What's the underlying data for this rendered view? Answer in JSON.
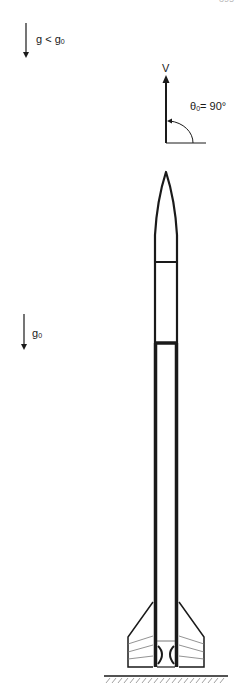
{
  "page_number": "395",
  "labels": {
    "gravity_upper": {
      "main": "g < g",
      "sub": "0"
    },
    "gravity_lower": {
      "main": "g",
      "sub": "0"
    },
    "velocity": "V",
    "angle": {
      "symbol": "θ",
      "sub": "0",
      "value": "= 90°"
    }
  },
  "diagram": {
    "parts": [
      "nose cone",
      "payload section",
      "motor tube",
      "fins",
      "nozzle",
      "launch ground"
    ],
    "colors": {
      "stroke": "#1a1a1a",
      "fin_detail": "#777777",
      "background": "#ffffff"
    }
  }
}
